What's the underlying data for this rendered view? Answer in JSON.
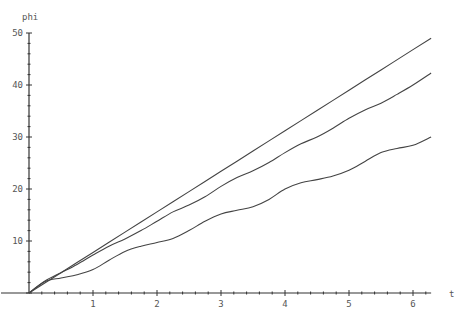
{
  "chart_data": {
    "type": "line",
    "title": "",
    "xlabel": "t",
    "ylabel": "phi",
    "xlim": [
      0,
      6.2832
    ],
    "ylim": [
      0,
      50
    ],
    "x_ticks": [
      1,
      2,
      3,
      4,
      5,
      6
    ],
    "y_ticks": [
      10,
      20,
      30,
      40,
      50
    ],
    "x_tick_labels": [
      "1",
      "2",
      "3",
      "4",
      "5",
      "6"
    ],
    "y_tick_labels": [
      "10",
      "20",
      "30",
      "40",
      "50"
    ],
    "grid": false,
    "legend": [],
    "line_color": "#444444",
    "axis_color": "#333333",
    "series": [
      {
        "name": "upper",
        "x": [
          0,
          0.5,
          1,
          1.5,
          2,
          2.5,
          3,
          3.5,
          4,
          4.5,
          5,
          5.5,
          6,
          6.2832
        ],
        "values": [
          0,
          3.9,
          7.8,
          11.7,
          15.6,
          19.5,
          23.4,
          27.3,
          31.2,
          35.1,
          39.0,
          42.9,
          46.8,
          49.0
        ]
      },
      {
        "name": "middle",
        "x": [
          0,
          0.25,
          0.5,
          0.75,
          1,
          1.25,
          1.5,
          1.75,
          2,
          2.25,
          2.5,
          2.75,
          3,
          3.25,
          3.5,
          3.75,
          4,
          4.25,
          4.5,
          4.75,
          5,
          5.25,
          5.5,
          5.75,
          6,
          6.2832
        ],
        "values": [
          0,
          2.3,
          3.9,
          5.5,
          7.3,
          9.0,
          10.4,
          12.0,
          13.8,
          15.6,
          16.9,
          18.5,
          20.5,
          22.2,
          23.5,
          25.1,
          27.0,
          28.7,
          30.0,
          31.7,
          33.6,
          35.2,
          36.5,
          38.2,
          40.0,
          42.3
        ]
      },
      {
        "name": "lower",
        "x": [
          0,
          0.25,
          0.5,
          0.75,
          1,
          1.25,
          1.5,
          1.75,
          2,
          2.25,
          2.5,
          2.75,
          3,
          3.25,
          3.5,
          3.75,
          4,
          4.25,
          4.5,
          4.75,
          5,
          5.25,
          5.5,
          5.75,
          6,
          6.2832
        ],
        "values": [
          0,
          2.2,
          2.9,
          3.5,
          4.5,
          6.3,
          8.0,
          9.0,
          9.7,
          10.5,
          12.0,
          13.8,
          15.2,
          15.9,
          16.6,
          18.0,
          20.0,
          21.2,
          21.8,
          22.5,
          23.6,
          25.3,
          27.0,
          27.8,
          28.4,
          30.0
        ]
      }
    ]
  },
  "axes": {
    "x_label": "t",
    "y_label": "phi"
  }
}
